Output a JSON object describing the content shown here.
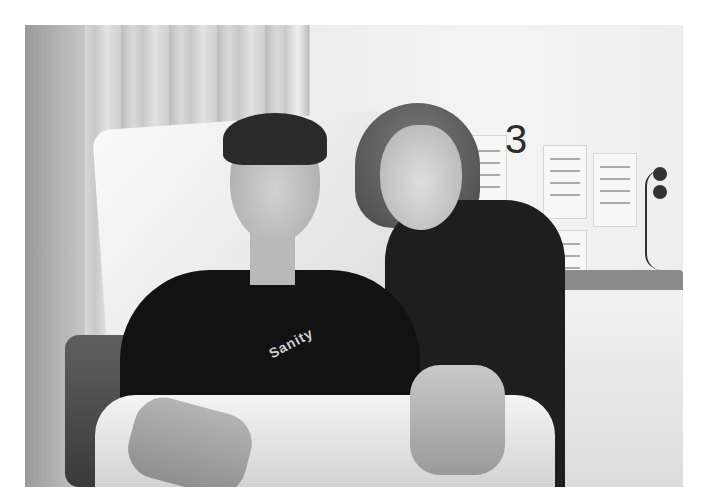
{
  "image": {
    "description": "Black and white photo of a young man sitting up in a hospital bed with an older woman leaning beside him, her hand resting on his arm",
    "subjects": [
      "young man in black t-shirt",
      "older woman in dark cardigan"
    ],
    "setting": "hospital ward bay"
  },
  "wall_sign": {
    "bay_number": "3"
  },
  "shirt": {
    "print_text": "Sanity"
  },
  "notices": [
    {
      "label": "handwritten notice"
    },
    {
      "label": "handwritten notice"
    },
    {
      "label": "handwritten notice"
    },
    {
      "label": "handwritten notice"
    },
    {
      "label": "handwritten notice"
    }
  ]
}
